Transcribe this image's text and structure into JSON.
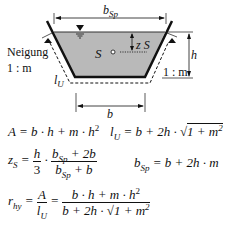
{
  "diagram": {
    "type": "trapezoidal channel cross-section",
    "labels": {
      "top_width": "b",
      "top_width_sub": "Sp",
      "bottom_width": "b",
      "height": "h",
      "centroid": "S",
      "centroid_depth": "z",
      "centroid_depth_sub": "S",
      "slope_label": "Neigung",
      "slope_ratio_left": "1 : m",
      "slope_ratio_right": "1 : m",
      "wetted_perimeter": "l",
      "wetted_perimeter_sub": "U"
    },
    "colors": {
      "water_fill": "#b9b9b9",
      "lines": "#111111",
      "background": "#ffffff"
    }
  },
  "formulas": {
    "area": {
      "lhs": "A",
      "rhs": "b · h + m · h",
      "exp": "2"
    },
    "perimeter": {
      "lhs": "l",
      "lhs_sub": "U",
      "rhs": "= b + 2h · ",
      "root": "1 + m",
      "exp": "2"
    },
    "centroid": {
      "lhs": "z",
      "lhs_sub": "S",
      "frac1_num": "h",
      "frac1_den": "3",
      "frac2_num": "b",
      "frac2_num_sub": "Sp",
      "frac2_num_tail": " + 2b",
      "frac2_den": "b",
      "frac2_den_sub": "Sp",
      "frac2_den_tail": " + b"
    },
    "top_width": {
      "lhs": "b",
      "lhs_sub": "Sp",
      "rhs": "= b + 2h · m"
    },
    "hydraulic_radius": {
      "lhs": "r",
      "lhs_sub": "hy",
      "frac1_num": "A",
      "frac1_den": "l",
      "frac1_den_sub": "U",
      "frac2_num": "b · h + m · h",
      "frac2_num_exp": "2",
      "frac2_den": "b + 2h · ",
      "frac2_den_root": "1 + m",
      "frac2_den_exp": "2"
    }
  }
}
